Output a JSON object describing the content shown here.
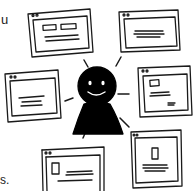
{
  "illustration": {
    "description": "Hand-drawn person surrounded by browser windows",
    "stroke_color": "#1a1a1a",
    "background": "#ffffff"
  },
  "edge_text": {
    "top_fragment": "u",
    "bottom_fragment": "s."
  },
  "person": {
    "icon": "person-smiling-icon",
    "fill": "#000000"
  },
  "windows": [
    {
      "id": "top-left",
      "content": "two-buttons-and-lines"
    },
    {
      "id": "top-right",
      "content": "text-lines"
    },
    {
      "id": "mid-left",
      "content": "text-lines"
    },
    {
      "id": "right",
      "content": "image-and-lines"
    },
    {
      "id": "bottom-left",
      "content": "image-and-lines"
    },
    {
      "id": "bottom-right",
      "content": "image-and-lines"
    }
  ]
}
